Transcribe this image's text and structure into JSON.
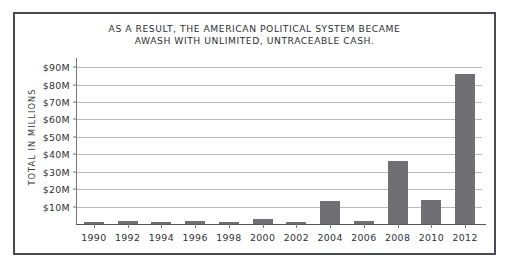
{
  "chart_data": {
    "type": "bar",
    "title": "AS A RESULT, THE AMERICAN POLITICAL SYSTEM BECAME\nAWASH WITH UNLIMITED, UNTRACEABLE CASH.",
    "xlabel": "",
    "ylabel": "TOTAL IN MILLIONS",
    "categories": [
      "1990",
      "1992",
      "1994",
      "1996",
      "1998",
      "2000",
      "2002",
      "2004",
      "2006",
      "2008",
      "2010",
      "2012"
    ],
    "values": [
      1.0,
      1.8,
      1.2,
      1.5,
      1.0,
      2.6,
      0.9,
      13.0,
      1.5,
      36.0,
      14.0,
      86.0
    ],
    "ylim": [
      0,
      93
    ],
    "yticks": [
      10,
      20,
      30,
      40,
      50,
      60,
      70,
      80,
      90
    ],
    "ytick_labels": [
      "$10M",
      "$20M",
      "$30M",
      "$40M",
      "$50M",
      "$60M",
      "$70M",
      "$80M",
      "$90M"
    ],
    "grid": true,
    "legend": null,
    "bar_color": "#6f6f74",
    "grid_color": "#b9b9bd",
    "axis_color": "#76767c",
    "frame_color": "#4a4a52",
    "background": "#ffffff"
  }
}
